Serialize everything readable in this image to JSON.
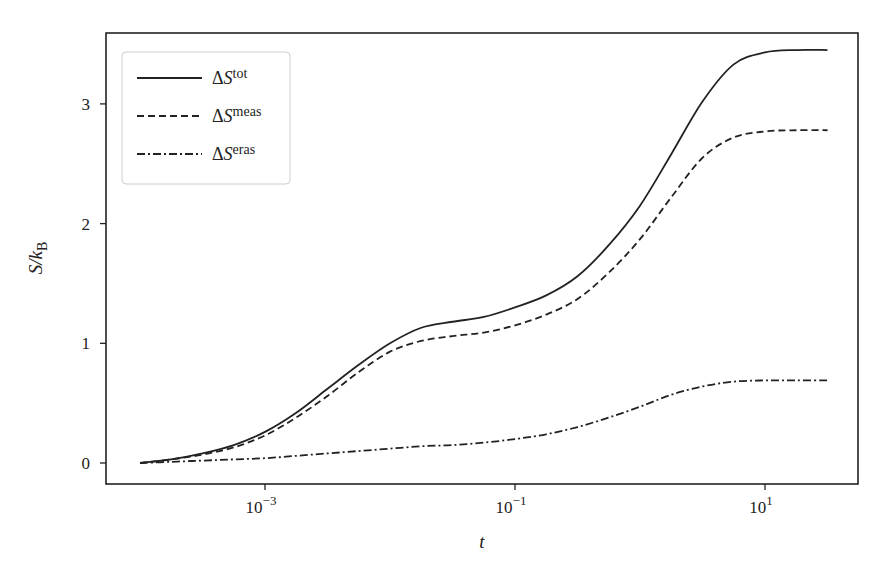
{
  "chart_data": {
    "type": "line",
    "title": "",
    "xlabel": "t",
    "ylabel": "S/k_B",
    "xscale": "log",
    "xlim_log10": [
      -4.27,
      1.75
    ],
    "ylim": [
      -0.18,
      3.6
    ],
    "grid": false,
    "legend_position": "upper left",
    "x_ticks": [
      {
        "log10": -3,
        "base": "10",
        "exp": "−3"
      },
      {
        "log10": -1,
        "base": "10",
        "exp": "−1"
      },
      {
        "log10": 1,
        "base": "10",
        "exp": "1"
      }
    ],
    "y_ticks": [
      0,
      1,
      2,
      3
    ],
    "x_log10": [
      -4,
      -3.75,
      -3.5,
      -3.25,
      -3,
      -2.75,
      -2.5,
      -2.25,
      -2,
      -1.75,
      -1.5,
      -1.25,
      -1,
      -0.75,
      -0.5,
      -0.25,
      0,
      0.25,
      0.5,
      0.75,
      1,
      1.25,
      1.5
    ],
    "series": [
      {
        "name": "ΔS^tot",
        "label_main": "ΔS",
        "label_sup": "tot",
        "style": "solid",
        "values": [
          0.0,
          0.03,
          0.08,
          0.15,
          0.26,
          0.42,
          0.62,
          0.82,
          1.0,
          1.13,
          1.18,
          1.22,
          1.3,
          1.4,
          1.56,
          1.82,
          2.15,
          2.58,
          3.02,
          3.33,
          3.43,
          3.45,
          3.45
        ]
      },
      {
        "name": "ΔS^meas",
        "label_main": "ΔS",
        "label_sup": "meas",
        "style": "dashed",
        "values": [
          0.0,
          0.03,
          0.07,
          0.13,
          0.23,
          0.38,
          0.56,
          0.76,
          0.93,
          1.02,
          1.06,
          1.09,
          1.15,
          1.24,
          1.37,
          1.59,
          1.87,
          2.22,
          2.55,
          2.72,
          2.77,
          2.78,
          2.78
        ]
      },
      {
        "name": "ΔS^eras",
        "label_main": "ΔS",
        "label_sup": "eras",
        "style": "dashdot",
        "values": [
          0.0,
          0.01,
          0.02,
          0.03,
          0.04,
          0.06,
          0.08,
          0.1,
          0.12,
          0.14,
          0.15,
          0.17,
          0.2,
          0.24,
          0.3,
          0.38,
          0.47,
          0.57,
          0.64,
          0.68,
          0.69,
          0.69,
          0.69
        ]
      }
    ]
  }
}
